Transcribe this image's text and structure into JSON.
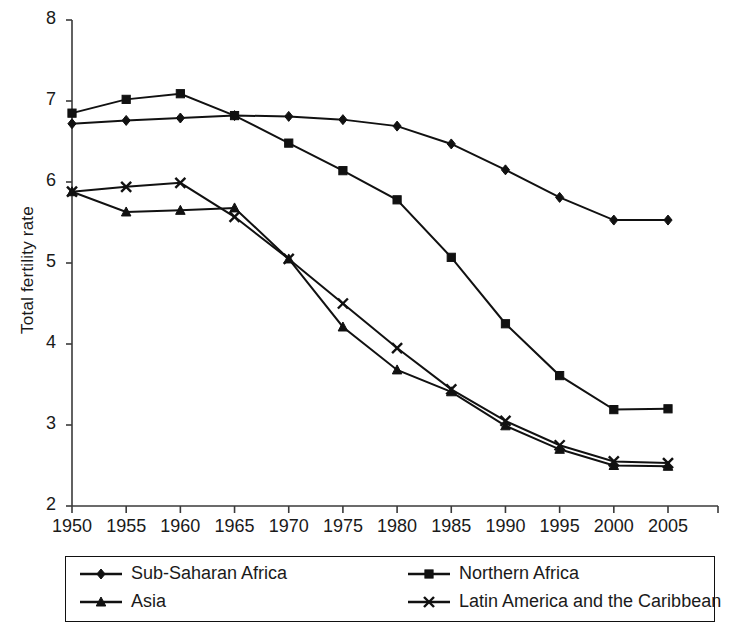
{
  "chart_data": {
    "type": "line",
    "title": "",
    "xlabel": "",
    "ylabel": "Total fertility rate",
    "x": [
      1950,
      1955,
      1960,
      1965,
      1970,
      1975,
      1980,
      1985,
      1990,
      1995,
      2000,
      2005
    ],
    "xtick_labels": [
      "1950",
      "1955",
      "1960",
      "1965",
      "1970",
      "1975",
      "1980",
      "1985",
      "1990",
      "1995",
      "2000",
      "2005"
    ],
    "ytick_labels": [
      "2",
      "3",
      "4",
      "5",
      "6",
      "7",
      "8"
    ],
    "ytick_values": [
      2,
      3,
      4,
      5,
      6,
      7,
      8
    ],
    "xlim": [
      1947.5,
      2007.5
    ],
    "ylim": [
      2,
      8
    ],
    "grid": false,
    "legend_position": "bottom",
    "series": [
      {
        "name": "Sub-Saharan Africa",
        "marker": "diamond",
        "values": [
          6.72,
          6.76,
          6.79,
          6.82,
          6.81,
          6.77,
          6.69,
          6.47,
          6.15,
          5.81,
          5.53,
          5.53
        ]
      },
      {
        "name": "Northern Africa",
        "marker": "square",
        "values": [
          6.85,
          7.02,
          7.09,
          6.82,
          6.48,
          6.14,
          5.78,
          5.07,
          4.25,
          3.61,
          3.19,
          3.2
        ]
      },
      {
        "name": "Asia",
        "marker": "triangle",
        "values": [
          5.88,
          5.63,
          5.65,
          5.68,
          5.05,
          4.21,
          3.68,
          3.41,
          2.99,
          2.7,
          2.5,
          2.49
        ]
      },
      {
        "name": "Latin America and the Caribbean",
        "marker": "x",
        "values": [
          5.88,
          5.94,
          5.99,
          5.57,
          5.05,
          4.5,
          3.95,
          3.44,
          3.05,
          2.75,
          2.55,
          2.53
        ]
      }
    ]
  },
  "legend": {
    "entries": [
      {
        "label": "Sub-Saharan Africa",
        "marker": "diamond"
      },
      {
        "label": "Northern Africa",
        "marker": "square"
      },
      {
        "label": "Asia",
        "marker": "triangle"
      },
      {
        "label": "Latin America and the Caribbean",
        "marker": "x"
      }
    ]
  }
}
